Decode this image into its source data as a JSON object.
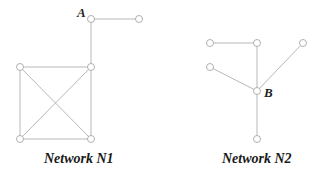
{
  "diagram": {
    "networks": [
      {
        "id": "N1",
        "caption": "Network N1",
        "caption_pos": [
          44,
          163
        ],
        "nodes": [
          {
            "id": "A",
            "x": 91,
            "y": 19,
            "label": "A",
            "label_pos": [
              77,
              17
            ]
          },
          {
            "id": "n1_right",
            "x": 139,
            "y": 19
          },
          {
            "id": "n1_tl",
            "x": 20,
            "y": 67
          },
          {
            "id": "n1_tr",
            "x": 91,
            "y": 67
          },
          {
            "id": "n1_bl",
            "x": 20,
            "y": 139
          },
          {
            "id": "n1_br",
            "x": 91,
            "y": 139
          }
        ],
        "edges": [
          [
            "A",
            "n1_right"
          ],
          [
            "A",
            "n1_tr"
          ],
          [
            "n1_tl",
            "n1_tr"
          ],
          [
            "n1_tl",
            "n1_bl"
          ],
          [
            "n1_tr",
            "n1_br"
          ],
          [
            "n1_bl",
            "n1_br"
          ],
          [
            "n1_tl",
            "n1_br"
          ],
          [
            "n1_tr",
            "n1_bl"
          ]
        ]
      },
      {
        "id": "N2",
        "caption": "Network N2",
        "caption_pos": [
          222,
          163
        ],
        "nodes": [
          {
            "id": "n2_tl",
            "x": 210,
            "y": 43
          },
          {
            "id": "n2_tm",
            "x": 257,
            "y": 43
          },
          {
            "id": "n2_tr",
            "x": 303,
            "y": 43
          },
          {
            "id": "n2_l",
            "x": 210,
            "y": 67
          },
          {
            "id": "B",
            "x": 257,
            "y": 91,
            "label": "B",
            "label_pos": [
              264,
              97
            ]
          },
          {
            "id": "n2_b",
            "x": 257,
            "y": 139
          }
        ],
        "edges": [
          [
            "n2_tl",
            "n2_tm"
          ],
          [
            "n2_tm",
            "B"
          ],
          [
            "n2_tr",
            "B"
          ],
          [
            "n2_l",
            "B"
          ],
          [
            "B",
            "n2_b"
          ]
        ]
      }
    ],
    "colors": {
      "edge": "#b8b8b8",
      "node_stroke": "#a8a8a8",
      "node_fill": "#ffffff",
      "text": "#1a1a1a"
    },
    "node_radius": 3.5
  }
}
